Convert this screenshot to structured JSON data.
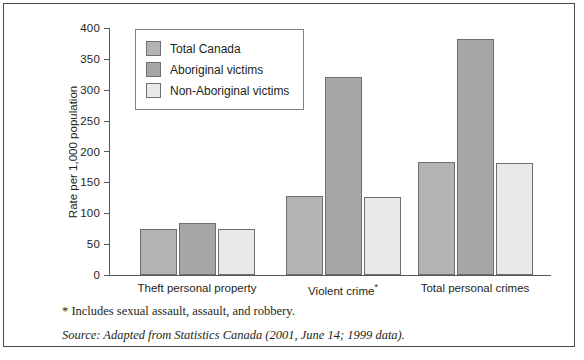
{
  "chart_data": {
    "type": "bar",
    "title": "",
    "xlabel": "",
    "ylabel": "Rate per 1,000 population",
    "ylim": [
      0,
      400
    ],
    "yticks": [
      0,
      50,
      100,
      150,
      200,
      250,
      300,
      350,
      400
    ],
    "grid": false,
    "legend_position": "top-left inside plot",
    "categories": [
      "Theft personal property",
      "Violent crime*",
      "Total personal crimes"
    ],
    "category_labels": [
      {
        "text": "Theft personal property",
        "footnote_marker": ""
      },
      {
        "text": "Violent crime",
        "footnote_marker": "*"
      },
      {
        "text": "Total personal crimes",
        "footnote_marker": ""
      }
    ],
    "series": [
      {
        "name": "Total Canada",
        "color": "#b3b3b3",
        "values": [
          75,
          128,
          183
        ]
      },
      {
        "name": "Aboriginal victims",
        "color": "#a6a6a6",
        "values": [
          85,
          320,
          382
        ]
      },
      {
        "name": "Non-Aboriginal victims",
        "color": "#e9e9e9",
        "values": [
          74,
          127,
          182
        ]
      }
    ]
  },
  "legend": {
    "items": [
      {
        "label": "Total Canada",
        "swatch": "#b3b3b3"
      },
      {
        "label": "Aboriginal victims",
        "swatch": "#a6a6a6"
      },
      {
        "label": "Non-Aboriginal victims",
        "swatch": "#e9e9e9"
      }
    ]
  },
  "axis": {
    "y_title": "Rate per 1,000 population",
    "y_ticks": [
      "400",
      "350",
      "300",
      "250",
      "200",
      "150",
      "100",
      "50",
      "0"
    ]
  },
  "notes": {
    "footnote": "* Includes sexual assault, assault, and robbery.",
    "source": "Source: Adapted from Statistics Canada (2001, June 14; 1999 data)."
  },
  "colors": {
    "frame_border": "#4a4a4a",
    "axis": "#58595b",
    "bar_outline": "#6d6e71",
    "background": "#ffffff"
  }
}
